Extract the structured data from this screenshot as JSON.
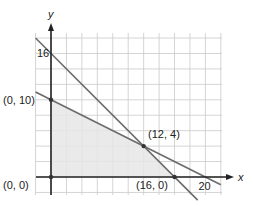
{
  "chart_data": {
    "type": "line",
    "title": "",
    "xlabel": "x",
    "ylabel": "y",
    "xlim": [
      -2,
      22
    ],
    "ylim": [
      -2,
      18.6
    ],
    "grid": true,
    "grid_step": 2,
    "lines": [
      {
        "name": "x + y = 16",
        "points": [
          [
            -2,
            18
          ],
          [
            19,
            -3
          ]
        ],
        "color": "#6b6b6b"
      },
      {
        "name": "x + 2y = 20",
        "points": [
          [
            -2,
            11
          ],
          [
            22,
            -1
          ]
        ],
        "color": "#6b6b6b"
      }
    ],
    "feasible_region": {
      "vertices": [
        [
          0,
          0
        ],
        [
          0,
          10
        ],
        [
          12,
          4
        ],
        [
          16,
          0
        ]
      ],
      "fill": "#e6e6e6"
    },
    "points": [
      {
        "x": 0,
        "y": 0,
        "label": "(0, 0)"
      },
      {
        "x": 0,
        "y": 10,
        "label": "(0, 10)"
      },
      {
        "x": 12,
        "y": 4,
        "label": "(12, 4)"
      },
      {
        "x": 16,
        "y": 0,
        "label": "(16, 0)"
      }
    ],
    "tick_labels": [
      {
        "axis": "y",
        "value": 16,
        "label": "16"
      },
      {
        "axis": "x",
        "value": 20,
        "label": "20"
      }
    ]
  }
}
